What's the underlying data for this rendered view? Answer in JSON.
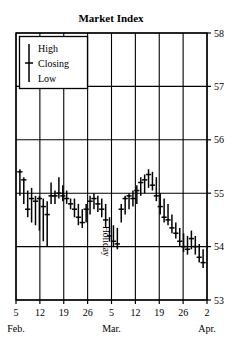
{
  "chart_data": {
    "type": "bar",
    "subtype": "ohlc-high-low-close",
    "title": "Market Index",
    "xlabel": "",
    "ylabel": "",
    "ylim": [
      53,
      58
    ],
    "yticks": [
      53,
      54,
      55,
      56,
      57,
      58
    ],
    "ytick_labels": [
      "53",
      "54",
      "55",
      "56",
      "57",
      "58"
    ],
    "grid": true,
    "legend_position": "top-left",
    "legend_entries": [
      "High",
      "Closing",
      "Low"
    ],
    "annotations": [
      {
        "text": "Holiday",
        "rotation": 90,
        "x_index": 21
      }
    ],
    "x_major_ticks": [
      {
        "label": "5",
        "month": "Feb."
      },
      {
        "label": "12",
        "month": ""
      },
      {
        "label": "19",
        "month": ""
      },
      {
        "label": "26",
        "month": ""
      },
      {
        "label": "5",
        "month": "Mar."
      },
      {
        "label": "12",
        "month": ""
      },
      {
        "label": "19",
        "month": ""
      },
      {
        "label": "26",
        "month": ""
      },
      {
        "label": "2",
        "month": "Apr."
      }
    ],
    "x_month_labels": [
      "Feb.",
      "Mar.",
      "Apr."
    ],
    "series_name": "Market Index",
    "bars": [
      {
        "i": 0,
        "high": 55.45,
        "low": 54.95,
        "close": 55.4
      },
      {
        "i": 1,
        "high": 55.3,
        "low": 54.8,
        "close": 55.25
      },
      {
        "i": 2,
        "high": 55.05,
        "low": 54.55,
        "close": 54.7
      },
      {
        "i": 3,
        "high": 55.1,
        "low": 54.45,
        "close": 54.9
      },
      {
        "i": 4,
        "high": 54.95,
        "low": 54.4,
        "close": 54.85
      },
      {
        "i": 5,
        "high": 54.95,
        "low": 54.3,
        "close": 54.9
      },
      {
        "i": 6,
        "high": 54.9,
        "low": 54.1,
        "close": 54.75
      },
      {
        "i": 7,
        "high": 54.85,
        "low": 54.0,
        "close": 54.6
      },
      {
        "i": 8,
        "high": 55.2,
        "low": 54.8,
        "close": 54.95
      },
      {
        "i": 9,
        "high": 55.05,
        "low": 54.8,
        "close": 54.95
      },
      {
        "i": 10,
        "high": 55.3,
        "low": 54.9,
        "close": 55.0
      },
      {
        "i": 11,
        "high": 55.15,
        "low": 54.85,
        "close": 54.95
      },
      {
        "i": 12,
        "high": 55.05,
        "low": 54.8,
        "close": 54.9
      },
      {
        "i": 13,
        "high": 54.9,
        "low": 54.7,
        "close": 54.8
      },
      {
        "i": 14,
        "high": 54.9,
        "low": 54.55,
        "close": 54.7
      },
      {
        "i": 15,
        "high": 54.8,
        "low": 54.4,
        "close": 54.55
      },
      {
        "i": 16,
        "high": 54.7,
        "low": 54.35,
        "close": 54.45
      },
      {
        "i": 17,
        "high": 54.8,
        "low": 54.45,
        "close": 54.7
      },
      {
        "i": 18,
        "high": 54.95,
        "low": 54.6,
        "close": 54.85
      },
      {
        "i": 19,
        "high": 55.0,
        "low": 54.7,
        "close": 54.9
      },
      {
        "i": 20,
        "high": 54.95,
        "low": 54.65,
        "close": 54.8
      },
      {
        "i": 21,
        "high": 54.9,
        "low": 54.55,
        "close": 54.7
      },
      {
        "i": 22,
        "high": 54.8,
        "low": 54.35,
        "close": 54.5
      },
      {
        "i": 23,
        "high": 54.55,
        "low": 54.1,
        "close": 54.2
      },
      {
        "i": 24,
        "high": 54.4,
        "low": 54.0,
        "close": 54.1
      },
      {
        "i": 25,
        "high": 54.35,
        "low": 53.95,
        "close": 54.05
      },
      {
        "i": 26,
        "high": 54.8,
        "low": 54.45,
        "close": 54.7
      },
      {
        "i": 27,
        "high": 54.95,
        "low": 54.6,
        "close": 54.9
      },
      {
        "i": 28,
        "high": 55.0,
        "low": 54.7,
        "close": 54.95
      },
      {
        "i": 29,
        "high": 55.05,
        "low": 54.75,
        "close": 54.9
      },
      {
        "i": 30,
        "high": 55.15,
        "low": 54.8,
        "close": 55.05
      },
      {
        "i": 31,
        "high": 55.3,
        "low": 54.95,
        "close": 55.2
      },
      {
        "i": 32,
        "high": 55.35,
        "low": 55.0,
        "close": 55.25
      },
      {
        "i": 33,
        "high": 55.45,
        "low": 55.1,
        "close": 55.35
      },
      {
        "i": 34,
        "high": 55.4,
        "low": 55.05,
        "close": 55.15
      },
      {
        "i": 35,
        "high": 55.3,
        "low": 54.85,
        "close": 54.95
      },
      {
        "i": 36,
        "high": 55.0,
        "low": 54.6,
        "close": 54.75
      },
      {
        "i": 37,
        "high": 54.9,
        "low": 54.45,
        "close": 54.55
      },
      {
        "i": 38,
        "high": 54.8,
        "low": 54.4,
        "close": 54.5
      },
      {
        "i": 39,
        "high": 54.6,
        "low": 54.25,
        "close": 54.35
      },
      {
        "i": 40,
        "high": 54.45,
        "low": 54.15,
        "close": 54.25
      },
      {
        "i": 41,
        "high": 54.35,
        "low": 54.0,
        "close": 54.1
      },
      {
        "i": 42,
        "high": 54.25,
        "low": 53.9,
        "close": 54.0
      },
      {
        "i": 43,
        "high": 54.2,
        "low": 53.85,
        "close": 53.95
      },
      {
        "i": 44,
        "high": 54.3,
        "low": 53.95,
        "close": 54.15
      },
      {
        "i": 45,
        "high": 54.2,
        "low": 53.85,
        "close": 54.0
      },
      {
        "i": 46,
        "high": 54.05,
        "low": 53.7,
        "close": 53.8
      },
      {
        "i": 47,
        "high": 53.95,
        "low": 53.6,
        "close": 53.7
      }
    ]
  },
  "colors": {
    "ink": "#000000",
    "background": "#ffffff"
  }
}
